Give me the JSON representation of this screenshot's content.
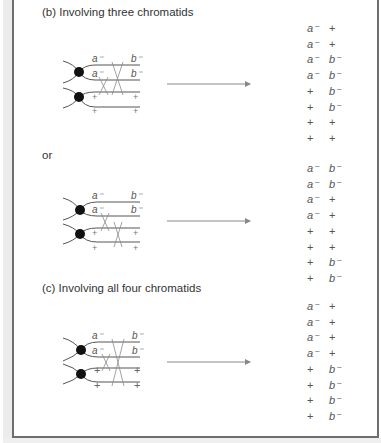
{
  "sections": [
    {
      "id": "b",
      "heading": "(b) Involving three chromatids",
      "heading_pos": [
        42,
        6
      ],
      "diagram": {
        "top_labels": [
          "a⁻",
          "b⁻"
        ],
        "second_labels": [
          "a⁻",
          "b⁻"
        ],
        "third_labels": [
          "+",
          "+"
        ],
        "fourth_labels": [
          "+",
          "+"
        ]
      },
      "results": [
        [
          "a⁻",
          "+"
        ],
        [
          "a⁻",
          "+"
        ],
        [
          "a⁻",
          "b⁻"
        ],
        [
          "a⁻",
          "b⁻"
        ],
        [
          "+",
          "b⁻"
        ],
        [
          "+",
          "b⁻"
        ],
        [
          "+",
          "+"
        ],
        [
          "+",
          "+"
        ]
      ]
    },
    {
      "id": "or",
      "heading": "or",
      "heading_pos": [
        42,
        149
      ],
      "diagram": {
        "top_labels": [
          "a⁻",
          "b⁻"
        ],
        "second_labels": [
          "a⁻",
          "b⁻"
        ],
        "third_labels": [
          "+",
          "+"
        ],
        "fourth_labels": [
          "+",
          "+"
        ]
      },
      "results": [
        [
          "a⁻",
          "b⁻"
        ],
        [
          "a⁻",
          "b⁻"
        ],
        [
          "a⁻",
          "+"
        ],
        [
          "a⁻",
          "+"
        ],
        [
          "+",
          "+"
        ],
        [
          "+",
          "+"
        ],
        [
          "+",
          "b⁻"
        ],
        [
          "+",
          "b⁻"
        ]
      ]
    },
    {
      "id": "c",
      "heading": "(c) Involving all four chromatids",
      "heading_pos": [
        42,
        282
      ],
      "diagram": {
        "top_labels": [
          "a⁻",
          "b⁻"
        ],
        "second_labels": [
          "a⁻",
          "b⁻"
        ],
        "third_labels": [
          "+",
          "+"
        ],
        "fourth_labels": [
          "+",
          "+"
        ]
      },
      "results": [
        [
          "a⁻",
          "+"
        ],
        [
          "a⁻",
          "+"
        ],
        [
          "a⁻",
          "+"
        ],
        [
          "a⁻",
          "+"
        ],
        [
          "+",
          "b⁻"
        ],
        [
          "+",
          "b⁻"
        ],
        [
          "+",
          "b⁻"
        ],
        [
          "+",
          "b⁻"
        ]
      ]
    }
  ],
  "colors": {
    "strand": "#555555",
    "crossover": "#8a8a8a",
    "centromere": "#111111",
    "arrow": "#888888",
    "text": "#3a3a3a"
  }
}
